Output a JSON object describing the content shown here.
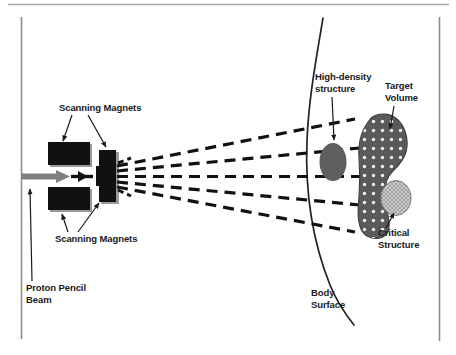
{
  "figure": {
    "background_color": "#ffffff",
    "frame": {
      "top_rule_color": "#a8a8a8",
      "side_line_color": "#8c8c8c"
    }
  },
  "labels": {
    "scanning_magnets_top": "Scanning Magnets",
    "scanning_magnets_bottom": "Scanning Magnets",
    "proton_pencil_beam_line1": "Proton Pencil",
    "proton_pencil_beam_line2": "Beam",
    "high_density_line1": "High-density",
    "high_density_line2": "structure",
    "target_volume_line1": "Target",
    "target_volume_line2": "Volume",
    "critical_structure_line1": "Critical",
    "critical_structure_line2": "Structure",
    "body_surface_line1": "Body",
    "body_surface_line2": "Surface"
  },
  "colors": {
    "magnet_fill": "#111111",
    "magnet_shadow": "#9a9a9a",
    "beam_arrow": "#808080",
    "beam_dash": "#111111",
    "body_surface_line": "#222222",
    "high_density_fill": "#5e5e5e",
    "target_volume_fill": "#5a5a5a",
    "target_volume_dots": "#f2f2f2",
    "critical_structure_fill": "#c9c9c9",
    "critical_structure_hatch": "#8f8f8f",
    "leader_line": "#1a1a1a",
    "text": "#1a1a1a"
  },
  "elements": {
    "magnet_upper": "upper scanning magnet block",
    "magnet_lower": "lower scanning magnet block",
    "magnet_vertical": "vertical scanning magnet block",
    "beam_line_count": 5,
    "body_surface": "curved body surface contour",
    "high_density_structure": "solid gray ellipse inline with beam",
    "target_volume": "dotted irregular boot-shaped volume",
    "critical_structure": "light hatched ellipse adjacent to target"
  }
}
